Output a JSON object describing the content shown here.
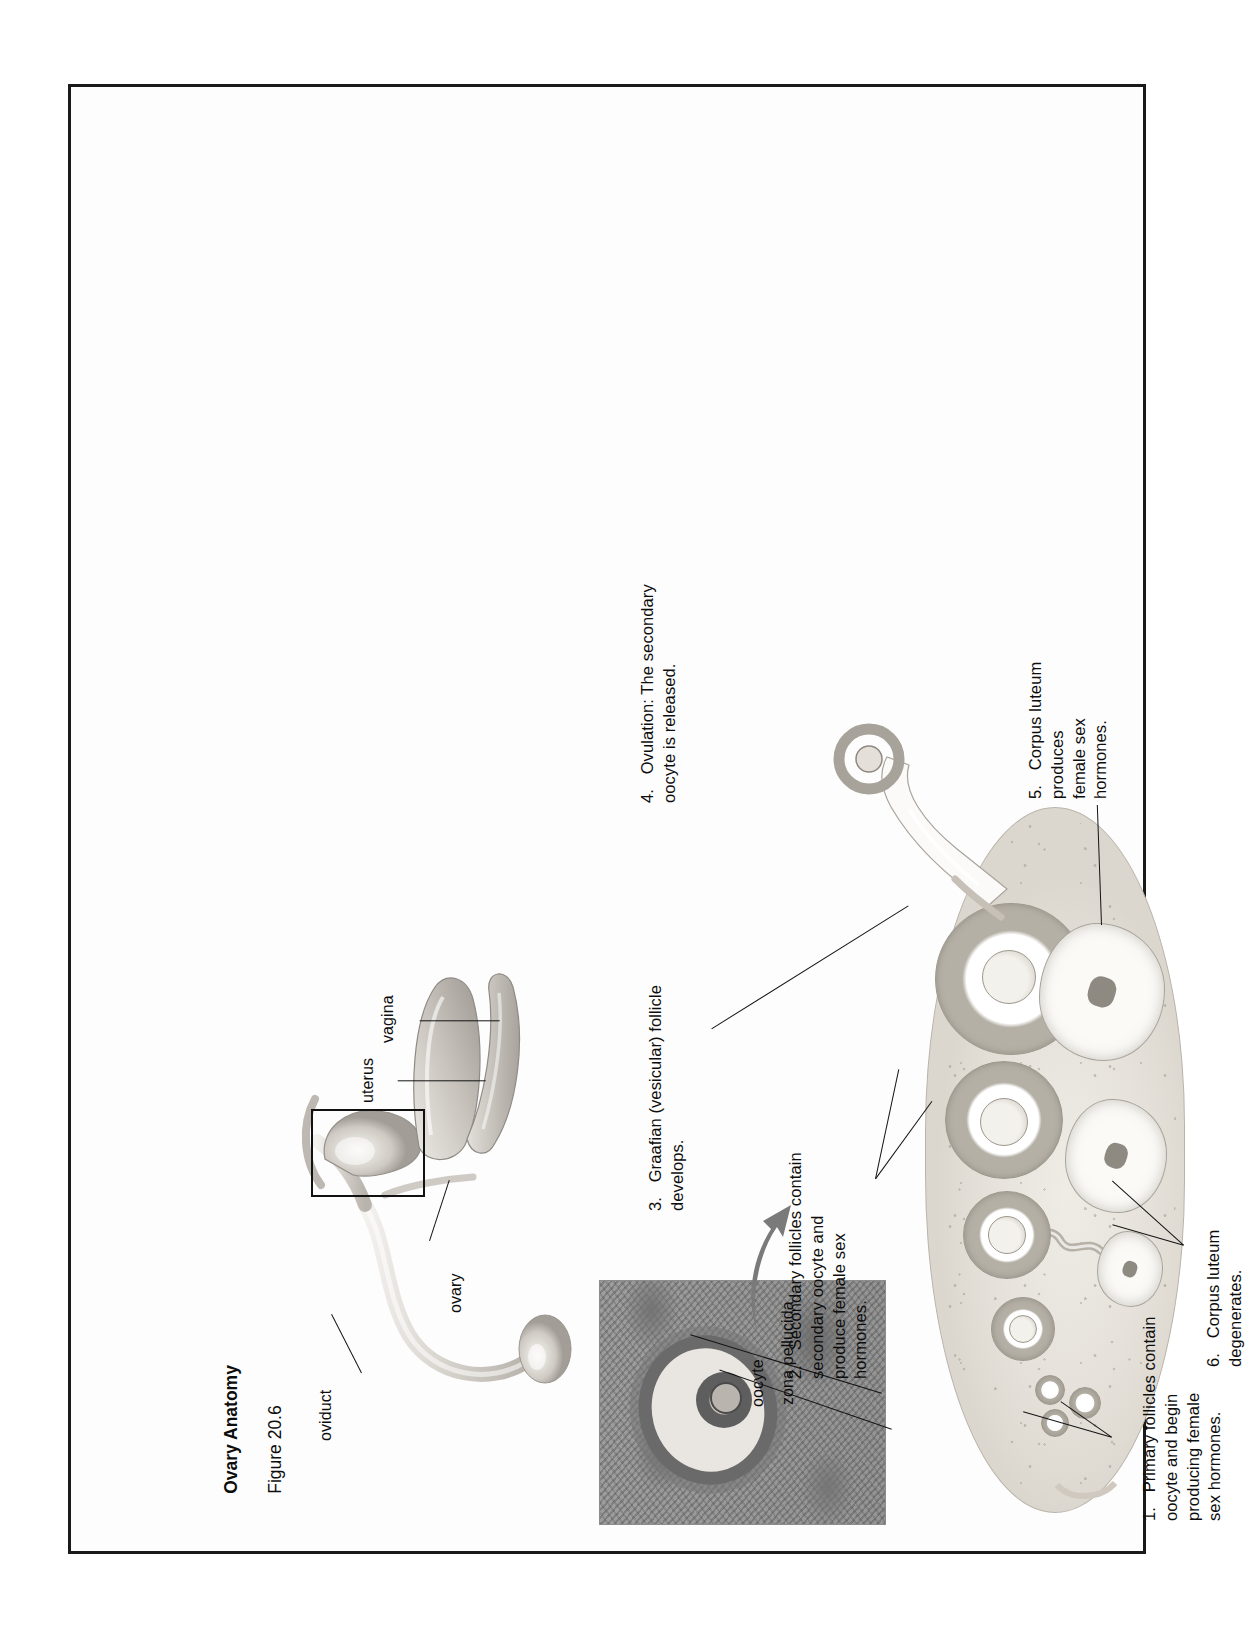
{
  "figure": {
    "title": "Ovary Anatomy",
    "figure_number": "Figure 20.6"
  },
  "organ_labels": [
    {
      "id": "oviduct",
      "text": "oviduct"
    },
    {
      "id": "ovary",
      "text": "ovary"
    },
    {
      "id": "uterus",
      "text": "uterus"
    },
    {
      "id": "vagina",
      "text": "vagina"
    }
  ],
  "micrograph_labels": [
    {
      "id": "oocyte",
      "text": "oocyte"
    },
    {
      "id": "zona-pellucida",
      "text": "zona pellucida"
    }
  ],
  "steps": [
    {
      "number": "1.",
      "text": "Primary follicles contain\noocyte and begin\nproducing female\nsex hormones."
    },
    {
      "number": "2.",
      "text": "Secondary follicles contain\nsecondary oocyte and\nproduce female sex\nhormones."
    },
    {
      "number": "3.",
      "text": "Graafian (vesicular) follicle\ndevelops."
    },
    {
      "number": "4.",
      "text": "Ovulation: The secondary\noocyte is released."
    },
    {
      "number": "5.",
      "text": "Corpus luteum\nproduces\nfemale sex\nhormones."
    },
    {
      "number": "6.",
      "text": "Corpus luteum\ndegenerates."
    }
  ],
  "colors": {
    "page_background": "#ffffff",
    "frame_border": "#1a1a1a",
    "text": "#0d0d0d",
    "ovary_fill": "#e6e2db",
    "follicle_ring": "#b5b0a6",
    "micrograph": "#9a9a9a"
  }
}
